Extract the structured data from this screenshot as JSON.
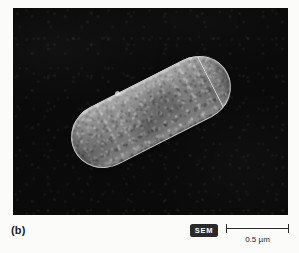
{
  "figure": {
    "panel_label": "(b)",
    "micrograph": {
      "subject": "rod-shaped bacterium (bacillus)",
      "background_color": "#0a0a0a",
      "cell_color": "#8c8c8c"
    },
    "imaging_mode_badge": {
      "label": "SEM",
      "background_color": "#2a2a2a",
      "text_color": "#ffffff"
    },
    "scale_bar": {
      "label": "0.5 µm",
      "value": 0.5,
      "unit": "µm",
      "color": "#2b2b2b"
    }
  }
}
